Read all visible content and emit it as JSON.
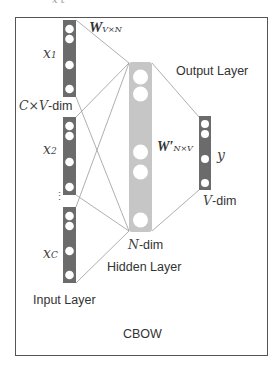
{
  "diagram": {
    "title": "CBOW",
    "cropped_top_text": "x  t",
    "colors": {
      "input_vector": "#6b6b6b",
      "hidden_vector": "#c6c6c6",
      "output_vector": "#6b6b6b",
      "connection_line": "#9a9a9a",
      "frame": "#555555",
      "text": "#333333"
    },
    "input_layer": {
      "label": "Input Layer",
      "dim_label_prefix": "C×V",
      "dim_label_suffix": "-dim",
      "vectors": [
        {
          "label": "x",
          "subscript": "1"
        },
        {
          "label": "x",
          "subscript": "2"
        },
        {
          "label": "x",
          "subscript": "C"
        }
      ],
      "ellipsis": "⋮"
    },
    "weights_in": {
      "symbol": "W",
      "subscript": "V×N"
    },
    "hidden_layer": {
      "label": "Hidden Layer",
      "dim_label_prefix": "N",
      "dim_label_suffix": "-dim"
    },
    "weights_out": {
      "symbol": "W′",
      "subscript": "N×V"
    },
    "output_layer": {
      "label": "Output Layer",
      "vector_label": "y",
      "dim_label_prefix": "V",
      "dim_label_suffix": "-dim"
    }
  }
}
